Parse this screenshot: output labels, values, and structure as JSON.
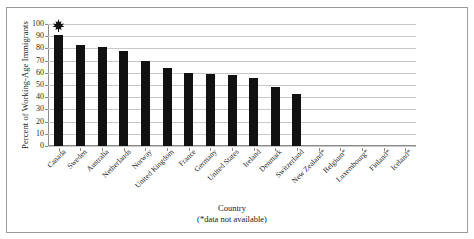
{
  "chart_data": {
    "type": "bar",
    "title": "",
    "xlabel": "Country",
    "xlabel_note": "(*data not available)",
    "ylabel": "Percent of Working-Age Immigrants",
    "ylim": [
      0,
      100
    ],
    "ytick_step": 10,
    "yticks": [
      100,
      90,
      80,
      70,
      60,
      50,
      40,
      30,
      20,
      10,
      0
    ],
    "grid": true,
    "legend": "none",
    "bar_color": "#111111",
    "gridline_color": "#c8c8c8",
    "categories": [
      "Canada",
      "Sweden",
      "Australia",
      "Netherlands",
      "Norway",
      "United Kingdom",
      "France",
      "Germany",
      "United States",
      "Ireland",
      "Denmark",
      "Switzerland",
      "New Zealand*",
      "Belgium*",
      "Luxembourg*",
      "Finland*",
      "Iceland*"
    ],
    "values": [
      91,
      83,
      81,
      78,
      70,
      64,
      60,
      59,
      58,
      56,
      48,
      43,
      null,
      null,
      null,
      null,
      null
    ],
    "annotations": [
      {
        "name": "maple-leaf-marker",
        "category": "Canada",
        "icon": "maple-leaf-icon",
        "description": "Black maple leaf symbol above the Canada bar"
      }
    ]
  }
}
